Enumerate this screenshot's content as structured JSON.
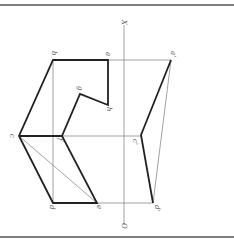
{
  "diagram": {
    "type": "orthographic-projection",
    "orientation": "rotated-90",
    "colors": {
      "thick_line": "#222222",
      "thin_line": "#8a8a8a",
      "label": "#555555",
      "border": "#555555"
    },
    "axis": {
      "top_label": "X",
      "bottom_label": "O"
    },
    "labels": {
      "a": "a",
      "b": "b",
      "c": "c",
      "d": "d",
      "e": "e",
      "f": "f",
      "g": "g",
      "h": "h",
      "a_prime": "a'",
      "c_prime": "c'",
      "d_prime": "d'"
    }
  }
}
